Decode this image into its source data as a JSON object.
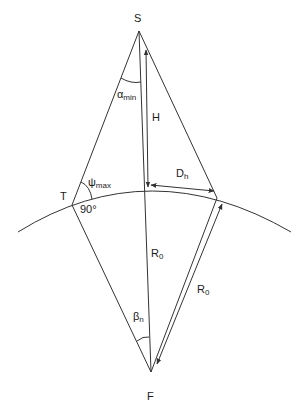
{
  "diagram": {
    "points": {
      "S": {
        "label": "S",
        "x": 139,
        "y": 31
      },
      "F": {
        "label": "F",
        "x": 151,
        "y": 372
      },
      "T": {
        "label": "T",
        "x": 72,
        "y": 205
      },
      "P": {
        "x": 217,
        "y": 198
      }
    },
    "labels": {
      "S": "S",
      "F": "F",
      "T": "T",
      "alpha": "α",
      "alpha_sub": "min",
      "psi": "ψ",
      "psi_sub": "max",
      "right_angle": "90°",
      "H": "H",
      "D": "D",
      "D_sub": "h",
      "R_center": "R",
      "R_center_sub": "0",
      "R_right": "R",
      "R_right_sub": "0",
      "beta": "β",
      "beta_sub": "n"
    },
    "colors": {
      "line": "#333333",
      "text": "#1a1a1a",
      "background": "#ffffff"
    }
  }
}
